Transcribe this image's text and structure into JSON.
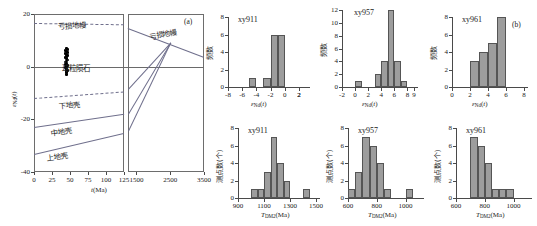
{
  "figure": {
    "panel_a_tag": "(a)",
    "panel_b_tag": "(b)",
    "caption": ""
  },
  "panel_a": {
    "name": "epsilon-nd-vs-time-evolution-diagram",
    "xlabel": "t(Ma)",
    "ylabel": "εNd(t)",
    "left_xticks": [
      "0",
      "25",
      "50",
      "75",
      "100",
      "125"
    ],
    "left_xrange": [
      0,
      125
    ],
    "right_xticks": [
      "1500",
      "2500",
      "3500"
    ],
    "right_xrange": [
      1250,
      3500
    ],
    "yticks": [
      "20",
      "0",
      "-20",
      "-40"
    ],
    "yrange": [
      -40,
      20
    ],
    "curve_labels": {
      "depleted_mantle": "亏损地幔",
      "depleted_mantle_right": "亏损地幔",
      "chondrite": "球粒陨石",
      "lower_crust": "下地壳",
      "middle_crust": "中地壳",
      "upper_crust": "上地壳"
    },
    "sample_cluster": {
      "t_Ma": 45,
      "eps_nd_range": [
        -3.0,
        7.0
      ],
      "n_points": 26
    },
    "reference_lines": [
      {
        "name": "depleted_mantle",
        "style": "dashed",
        "eps_at_0Ma": 16.5,
        "eps_at_125Ma": 16.0
      },
      {
        "name": "lower_crust",
        "style": "dashed",
        "eps_at_0Ma": -12.0,
        "eps_at_125Ma": -9.5
      },
      {
        "name": "middle_crust",
        "style": "solid",
        "eps_at_0Ma": -23.0,
        "eps_at_125Ma": -18.0
      },
      {
        "name": "upper_crust",
        "style": "solid",
        "eps_at_0Ma": -33.0,
        "eps_at_125Ma": -25.0
      }
    ],
    "right_lines": [
      {
        "name": "depleted_mantle_evolution",
        "from": [
          1250,
          14.5
        ],
        "to": [
          3500,
          3.5
        ]
      },
      {
        "name": "crustal_model_line_1",
        "from": [
          1250,
          -8.5
        ],
        "to": [
          2500,
          9.0
        ]
      },
      {
        "name": "crustal_model_line_2",
        "from": [
          1250,
          -18.0
        ],
        "to": [
          2500,
          9.0
        ]
      },
      {
        "name": "crustal_model_line_3",
        "from": [
          1250,
          -24.5
        ],
        "to": [
          2500,
          9.0
        ]
      }
    ]
  },
  "chart_data": [
    {
      "id": "hist-eps-xy911",
      "type": "bar",
      "title": "xy911",
      "xlabel": "εNd(t)",
      "ylabel": "频数",
      "xticks": [
        "-8",
        "-6",
        "-4",
        "-2",
        "0",
        "2",
        "2"
      ],
      "xlim": [
        -8,
        3
      ],
      "ylim": [
        0,
        8
      ],
      "yticks": [
        "0",
        "2",
        "4",
        "6",
        "8"
      ],
      "bin_width": 1,
      "bin_starts": [
        -5,
        -3,
        -2,
        -1
      ],
      "categories": [
        "-5",
        "-3",
        "-2",
        "-1"
      ],
      "values": [
        1,
        1,
        6,
        6
      ],
      "grid": false
    },
    {
      "id": "hist-eps-xy957",
      "type": "bar",
      "title": "xy957",
      "xlabel": "εNd(t)",
      "ylabel": "频数",
      "xticks": [
        "-2",
        "0",
        "2",
        "4",
        "6",
        "8",
        "9"
      ],
      "xlim": [
        -2,
        9
      ],
      "ylim": [
        0,
        12
      ],
      "yticks": [
        "0",
        "2",
        "4",
        "6",
        "8",
        "10",
        "12"
      ],
      "bin_width": 1,
      "bin_starts": [
        0,
        3,
        4,
        5,
        6,
        7
      ],
      "categories": [
        "0",
        "3",
        "4",
        "5",
        "6",
        "7"
      ],
      "values": [
        1,
        2,
        4,
        12,
        4,
        1
      ],
      "grid": false
    },
    {
      "id": "hist-eps-xy961",
      "type": "bar",
      "title": "xy961",
      "xlabel": "εNd(t)",
      "ylabel": "频数",
      "xticks": [
        "0",
        "2",
        "4",
        "6",
        "8"
      ],
      "xlim": [
        0,
        8
      ],
      "ylim": [
        0,
        8
      ],
      "yticks": [
        "0",
        "2",
        "4",
        "6",
        "8"
      ],
      "bin_width": 1,
      "bin_starts": [
        2,
        3,
        4,
        5
      ],
      "categories": [
        "2",
        "3",
        "4",
        "5"
      ],
      "values": [
        3,
        4,
        5,
        8
      ],
      "grid": false
    },
    {
      "id": "hist-tdm2-xy911",
      "type": "bar",
      "title": "xy911",
      "xlabel": "TDM2(Ma)",
      "ylabel": "测点数(个)",
      "xticks": [
        "900",
        "1100",
        "1300",
        "1500"
      ],
      "xlim": [
        900,
        1500
      ],
      "ylim": [
        0,
        8
      ],
      "yticks": [
        "0",
        "2",
        "4",
        "6",
        "8"
      ],
      "bin_width": 50,
      "bin_starts": [
        1000,
        1050,
        1100,
        1150,
        1200,
        1250,
        1400
      ],
      "categories": [
        "1000",
        "1050",
        "1100",
        "1150",
        "1200",
        "1250",
        "1400"
      ],
      "values": [
        1,
        1,
        3,
        7,
        4,
        2,
        1
      ],
      "grid": false
    },
    {
      "id": "hist-tdm2-xy957",
      "type": "bar",
      "title": "xy957",
      "xlabel": "TDM2(Ma)",
      "ylabel": "测点数(个)",
      "xticks": [
        "600",
        "800",
        "1000"
      ],
      "xlim": [
        600,
        1100
      ],
      "ylim": [
        0,
        8
      ],
      "yticks": [
        "0",
        "2",
        "4",
        "6",
        "8"
      ],
      "bin_width": 50,
      "bin_starts": [
        600,
        650,
        700,
        750,
        800,
        850,
        1000
      ],
      "categories": [
        "600",
        "650",
        "700",
        "750",
        "800",
        "850",
        "1000"
      ],
      "values": [
        1,
        3,
        7,
        6,
        4,
        1,
        1
      ],
      "grid": false
    },
    {
      "id": "hist-tdm2-xy961",
      "type": "bar",
      "title": "xy961",
      "xlabel": "TDM2(Ma)",
      "ylabel": "测点数(个)",
      "xticks": [
        "600",
        "800",
        "1000"
      ],
      "xlim": [
        600,
        1100
      ],
      "ylim": [
        0,
        8
      ],
      "yticks": [
        "0",
        "2",
        "4",
        "6",
        "8"
      ],
      "bin_width": 50,
      "bin_starts": [
        700,
        750,
        800,
        850,
        900,
        950
      ],
      "categories": [
        "700",
        "750",
        "800",
        "850",
        "900",
        "950"
      ],
      "values": [
        7,
        6,
        4,
        1,
        1,
        1
      ],
      "grid": false
    }
  ]
}
